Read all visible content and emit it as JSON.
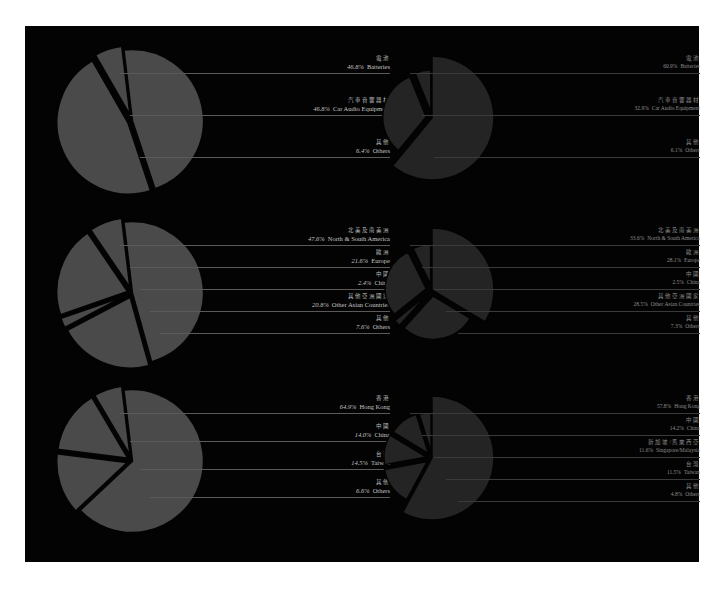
{
  "chart_data": [
    {
      "type": "pie",
      "id": "left-products",
      "style": "exploded-light",
      "categories_zh": [
        "電池",
        "汽車音響器材",
        "其他"
      ],
      "categories": [
        "Batteries",
        "Car Audio Equipment",
        "Others"
      ],
      "values": [
        46.8,
        46.8,
        6.4
      ],
      "labels_pct": [
        "46.8%",
        "46.8%",
        "6.4%"
      ]
    },
    {
      "type": "pie",
      "id": "right-products",
      "style": "exploded-dark",
      "categories_zh": [
        "電池",
        "汽車音響器材",
        "其他"
      ],
      "categories": [
        "Batteries",
        "Car Audio Equipment",
        "Others"
      ],
      "values": [
        60.9,
        32.9,
        6.1
      ],
      "labels_pct": [
        "60.9%",
        "32.9%",
        "6.1%"
      ]
    },
    {
      "type": "pie",
      "id": "left-regions",
      "style": "exploded-light",
      "categories_zh": [
        "北美及南美洲",
        "歐洲",
        "中國",
        "其他亞洲國家",
        "其他"
      ],
      "categories": [
        "North & South America",
        "Europe",
        "China",
        "Other Asian Countries",
        "Others"
      ],
      "values": [
        47.6,
        21.6,
        2.4,
        20.8,
        7.6
      ],
      "labels_pct": [
        "47.6%",
        "21.6%",
        "2.4%",
        "20.8%",
        "7.6%"
      ]
    },
    {
      "type": "pie",
      "id": "right-regions",
      "style": "exploded-dark",
      "categories_zh": [
        "北美及南美洲",
        "歐洲",
        "中國",
        "其他亞洲國家",
        "其他"
      ],
      "categories": [
        "North & South America",
        "Europe",
        "China",
        "Other Asian Countries",
        "Others"
      ],
      "values": [
        33.6,
        28.1,
        2.5,
        28.5,
        7.3
      ],
      "labels_pct": [
        "33.6%",
        "28.1%",
        "2.5%",
        "28.5%",
        "7.3%"
      ]
    },
    {
      "type": "pie",
      "id": "left-markets",
      "style": "exploded-light",
      "categories_zh": [
        "香港",
        "中國",
        "台灣",
        "其他"
      ],
      "categories": [
        "Hong Kong",
        "China",
        "Taiwan",
        "Others"
      ],
      "values": [
        64.9,
        14.0,
        14.5,
        6.6
      ],
      "labels_pct": [
        "64.9%",
        "14.0%",
        "14.5%",
        "6.6%"
      ]
    },
    {
      "type": "pie",
      "id": "right-markets",
      "style": "exploded-dark",
      "categories_zh": [
        "香港",
        "中國",
        "新加坡/馬來西亞",
        "台灣",
        "其他"
      ],
      "categories": [
        "Hong Kong",
        "China",
        "Singapore/Malaysia",
        "Taiwan",
        "Others"
      ],
      "values": [
        57.8,
        14.2,
        11.6,
        11.5,
        4.8
      ],
      "labels_pct": [
        "57.8%",
        "14.2%",
        "11.6%",
        "11.5%",
        "4.8%"
      ]
    }
  ],
  "colors": {
    "page_background": "#ffffff",
    "panel_background": "#030303",
    "left_slice": "#4a4a4a",
    "right_slice": "#242424",
    "leader_left": "#5a5a5a",
    "leader_right": "#3a3a3a"
  }
}
